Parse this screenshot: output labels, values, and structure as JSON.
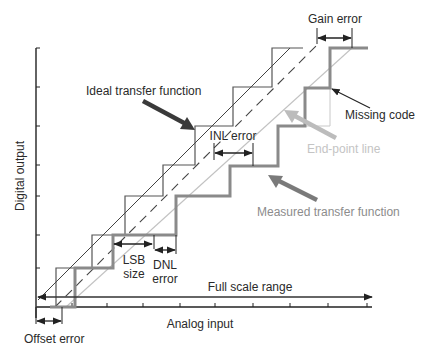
{
  "diagram": {
    "type": "ADC transfer function error diagram",
    "axes": {
      "x_label": "Analog input",
      "y_label": "Digital output"
    },
    "labels": {
      "ideal": "Ideal transfer function",
      "measured": "Measured transfer function",
      "endpoint": "End-point line",
      "missing_code": "Missing code",
      "gain_error": "Gain error",
      "inl_error": "INL error",
      "lsb_line1": "LSB",
      "lsb_line2": "size",
      "dnl_line1": "DNL",
      "dnl_line2": "error",
      "full_scale": "Full scale range",
      "offset_error": "Offset error"
    },
    "colors": {
      "ideal": "#555555",
      "measured": "#8a8a8a",
      "endpoint": "#bdbdbd",
      "axis": "#222222",
      "ideal_arrow": "#3a3a3a",
      "measured_arrow": "#7a7a7a",
      "endpoint_arrow": "#bcbcbc"
    }
  }
}
